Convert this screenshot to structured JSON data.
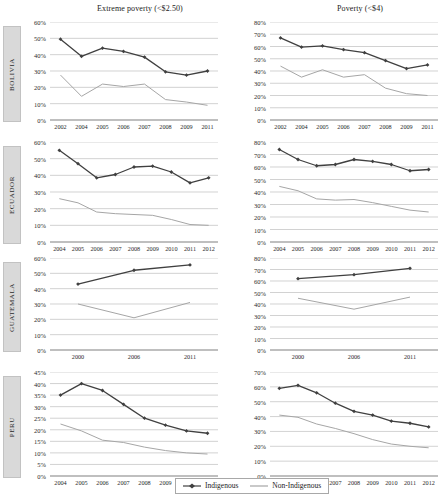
{
  "titles": {
    "left": "Extreme poverty (<$2.50)",
    "right": "Poverty (<$4)"
  },
  "legend": {
    "indigenous": "Indigenous",
    "non_indigenous": "Non-Indigenous"
  },
  "colors": {
    "indigenous": "#404040",
    "non_indigenous": "#a6a6a6",
    "gridline": "#bfbfbf",
    "axis": "#808080",
    "tab_bg": "#d9d9d9"
  },
  "countries": [
    "BOLIVIA",
    "ECUADOR",
    "GUATEMALA",
    "PERU"
  ],
  "chart_data": [
    {
      "type": "line",
      "title": "Extreme poverty (<$2.50)",
      "country": "BOLIVIA",
      "xlabel": "",
      "ylabel": "",
      "ylim": [
        0,
        60
      ],
      "yticks": [
        "0%",
        "10%",
        "20%",
        "30%",
        "40%",
        "50%",
        "60%"
      ],
      "grid": true,
      "legend_position": "bottom",
      "categories": [
        "2002",
        "2004",
        "2005",
        "2006",
        "2007",
        "2008",
        "2009",
        "2011"
      ],
      "series": [
        {
          "name": "Indigenous",
          "values": [
            49.5,
            39.0,
            44.0,
            42.0,
            38.5,
            29.5,
            27.5,
            30.0
          ]
        },
        {
          "name": "Non-Indigenous",
          "values": [
            27.5,
            14.5,
            22.0,
            20.5,
            22.0,
            12.5,
            11.0,
            9.0
          ]
        }
      ]
    },
    {
      "type": "line",
      "title": "Poverty (<$4)",
      "country": "BOLIVIA",
      "xlabel": "",
      "ylabel": "",
      "ylim": [
        0,
        80
      ],
      "yticks": [
        "0%",
        "10%",
        "20%",
        "30%",
        "40%",
        "50%",
        "60%",
        "70%",
        "80%"
      ],
      "grid": true,
      "legend_position": "bottom",
      "categories": [
        "2002",
        "2004",
        "2005",
        "2006",
        "2007",
        "2008",
        "2009",
        "2011"
      ],
      "series": [
        {
          "name": "Indigenous",
          "values": [
            67.0,
            59.5,
            60.5,
            57.5,
            55.0,
            48.5,
            42.0,
            45.0
          ]
        },
        {
          "name": "Non-Indigenous",
          "values": [
            44.0,
            35.0,
            41.0,
            35.0,
            37.0,
            26.0,
            21.5,
            20.0
          ]
        }
      ]
    },
    {
      "type": "line",
      "title": "Extreme poverty (<$2.50)",
      "country": "ECUADOR",
      "xlabel": "",
      "ylabel": "",
      "ylim": [
        0,
        60
      ],
      "yticks": [
        "0%",
        "10%",
        "20%",
        "30%",
        "40%",
        "50%",
        "60%"
      ],
      "grid": true,
      "legend_position": "bottom",
      "categories": [
        "2004",
        "2005",
        "2006",
        "2007",
        "2008",
        "2009",
        "2010",
        "2011",
        "2012"
      ],
      "series": [
        {
          "name": "Indigenous",
          "values": [
            55.0,
            47.0,
            38.5,
            40.5,
            45.0,
            45.5,
            42.0,
            35.5,
            38.5
          ]
        },
        {
          "name": "Non-Indigenous",
          "values": [
            26.0,
            23.5,
            18.0,
            17.0,
            16.5,
            16.0,
            13.5,
            10.5,
            10.0
          ]
        }
      ]
    },
    {
      "type": "line",
      "title": "Poverty (<$4)",
      "country": "ECUADOR",
      "xlabel": "",
      "ylabel": "",
      "ylim": [
        0,
        80
      ],
      "yticks": [
        "0%",
        "10%",
        "20%",
        "30%",
        "40%",
        "50%",
        "60%",
        "70%",
        "80%"
      ],
      "grid": true,
      "legend_position": "bottom",
      "categories": [
        "2004",
        "2005",
        "2006",
        "2007",
        "2008",
        "2009",
        "2010",
        "2011",
        "2012"
      ],
      "series": [
        {
          "name": "Indigenous",
          "values": [
            74.0,
            66.0,
            61.0,
            62.0,
            66.0,
            64.5,
            62.0,
            57.0,
            58.0
          ]
        },
        {
          "name": "Non-Indigenous",
          "values": [
            44.5,
            41.0,
            34.5,
            33.5,
            34.0,
            31.5,
            28.5,
            25.5,
            24.0
          ]
        }
      ]
    },
    {
      "type": "line",
      "title": "Extreme poverty (<$2.50)",
      "country": "GUATEMALA",
      "xlabel": "",
      "ylabel": "",
      "ylim": [
        0,
        60
      ],
      "yticks": [
        "0%",
        "10%",
        "20%",
        "30%",
        "40%",
        "50%",
        "60%"
      ],
      "grid": true,
      "legend_position": "bottom",
      "categories": [
        "2000",
        "2006",
        "2011"
      ],
      "series": [
        {
          "name": "Indigenous",
          "values": [
            43.0,
            52.0,
            55.5
          ]
        },
        {
          "name": "Non-Indigenous",
          "values": [
            30.0,
            21.0,
            31.0
          ]
        }
      ]
    },
    {
      "type": "line",
      "title": "Poverty (<$4)",
      "country": "GUATEMALA",
      "xlabel": "",
      "ylabel": "",
      "ylim": [
        0,
        80
      ],
      "yticks": [
        "0%",
        "10%",
        "20%",
        "30%",
        "40%",
        "50%",
        "60%",
        "70%",
        "80%"
      ],
      "grid": true,
      "legend_position": "bottom",
      "categories": [
        "2000",
        "2006",
        "2011"
      ],
      "series": [
        {
          "name": "Indigenous",
          "values": [
            62.0,
            65.5,
            71.0
          ]
        },
        {
          "name": "Non-Indigenous",
          "values": [
            45.0,
            35.5,
            46.0
          ]
        }
      ]
    },
    {
      "type": "line",
      "title": "Extreme poverty (<$2.50)",
      "country": "PERU",
      "xlabel": "",
      "ylabel": "",
      "ylim": [
        0,
        45
      ],
      "yticks": [
        "0%",
        "5%",
        "10%",
        "15%",
        "20%",
        "25%",
        "30%",
        "35%",
        "40%",
        "45%"
      ],
      "grid": true,
      "legend_position": "bottom",
      "categories": [
        "2004",
        "2005",
        "2006",
        "2007",
        "2008",
        "2009",
        "2010",
        "2011"
      ],
      "series": [
        {
          "name": "Indigenous",
          "values": [
            35.0,
            40.0,
            37.0,
            31.0,
            25.0,
            22.0,
            19.5,
            18.5
          ]
        },
        {
          "name": "Non-Indigenous",
          "values": [
            22.5,
            19.5,
            15.5,
            14.5,
            12.5,
            11.0,
            10.0,
            9.5
          ]
        }
      ]
    },
    {
      "type": "line",
      "title": "Poverty (<$4)",
      "country": "PERU",
      "xlabel": "",
      "ylabel": "",
      "ylim": [
        0,
        70
      ],
      "yticks": [
        "0%",
        "10%",
        "20%",
        "30%",
        "40%",
        "50%",
        "60%",
        "70%"
      ],
      "grid": true,
      "legend_position": "bottom",
      "categories": [
        "2004",
        "2005",
        "2006",
        "2007",
        "2008",
        "2009",
        "2010",
        "2011",
        "2012"
      ],
      "series": [
        {
          "name": "Indigenous",
          "values": [
            59.0,
            61.0,
            56.0,
            49.0,
            43.5,
            41.0,
            37.0,
            35.5,
            33.0
          ]
        },
        {
          "name": "Non-Indigenous",
          "values": [
            41.0,
            39.5,
            35.0,
            32.0,
            28.5,
            24.5,
            21.5,
            20.0,
            19.0
          ]
        }
      ]
    }
  ]
}
